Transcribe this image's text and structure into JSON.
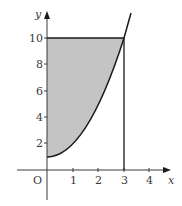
{
  "diagram": {
    "title": "",
    "curve": "y = x^2 + 1",
    "shaded_region": "between y-axis, y = 10 and curve, for 0 <= x <= 3",
    "x_axis": {
      "label": "x",
      "origin_label": "O",
      "ticks": [
        "1",
        "2",
        "3",
        "4"
      ]
    },
    "y_axis": {
      "label": "y",
      "ticks": [
        "2",
        "4",
        "6",
        "8",
        "10"
      ]
    },
    "lines": {
      "horizontal": "y = 10",
      "vertical": "x = 3"
    },
    "colors": {
      "shade": "#c4c4c4",
      "stroke": "#1a1a1a",
      "axis": "#3a3a3a"
    }
  }
}
